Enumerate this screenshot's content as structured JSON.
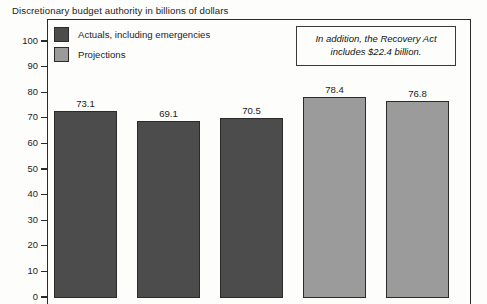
{
  "chart_data": {
    "type": "bar",
    "title": "Discretionary budget authority in billions of dollars",
    "xlabel": "",
    "ylabel": "",
    "ylim": [
      0,
      100
    ],
    "ytick_labels": [
      "100",
      "90",
      "80",
      "70",
      "60",
      "50",
      "40",
      "30",
      "20",
      "10",
      "0"
    ],
    "ytick_values": [
      100,
      90,
      80,
      70,
      60,
      50,
      40,
      30,
      20,
      10,
      0
    ],
    "grid": false,
    "legend_position": "inside top-left",
    "categories": [
      "",
      "",
      "",
      "",
      ""
    ],
    "values": [
      73.1,
      69.1,
      70.5,
      78.4,
      76.8
    ],
    "value_labels": [
      "73.1",
      "69.1",
      "70.5",
      "78.4",
      "76.8"
    ],
    "bars": [
      {
        "value": 73.1,
        "label": "73.1",
        "series": "Actuals, including emergencies"
      },
      {
        "value": 69.1,
        "label": "69.1",
        "series": "Actuals, including emergencies"
      },
      {
        "value": 70.5,
        "label": "70.5",
        "series": "Actuals, including emergencies"
      },
      {
        "value": 78.4,
        "label": "78.4",
        "series": "Projections"
      },
      {
        "value": 76.8,
        "label": "76.8",
        "series": "Projections"
      }
    ],
    "series": [
      {
        "name": "Actuals, including emergencies",
        "color": "#4c4c4c",
        "values": [
          73.1,
          69.1,
          70.5,
          null,
          null
        ]
      },
      {
        "name": "Projections",
        "color": "#9b9b9b",
        "values": [
          null,
          null,
          null,
          78.4,
          76.8
        ]
      }
    ],
    "annotations": [
      {
        "text": "In addition, the Recovery Act includes $22.4 billion.",
        "style": "italic",
        "position": "top-right"
      }
    ]
  },
  "legend": {
    "items": [
      {
        "label": "Actuals, including emergencies",
        "color": "#4c4c4c"
      },
      {
        "label": "Projections",
        "color": "#9b9b9b"
      }
    ]
  },
  "annotation": {
    "line1": "In addition, the Recovery Act",
    "line2": "includes $22.4 billion."
  },
  "colors": {
    "actuals": "#4c4c4c",
    "projections": "#9b9b9b",
    "axis": "#2a2a2a",
    "text": "#1c1c1c",
    "background": "#fdfdfc"
  }
}
